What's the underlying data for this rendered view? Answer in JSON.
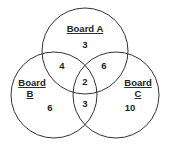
{
  "diagram": {
    "type": "venn",
    "sets": [
      {
        "id": "A",
        "label_line1": "Board A",
        "label_line2": "",
        "only": "3"
      },
      {
        "id": "B",
        "label_line1": "Board",
        "label_line2": "B",
        "only": "6"
      },
      {
        "id": "C",
        "label_line1": "Board",
        "label_line2": "C",
        "only": "10"
      }
    ],
    "intersections": {
      "AB": "4",
      "AC": "6",
      "BC": "3",
      "ABC": "2"
    },
    "colors": {
      "stroke": "#333333",
      "text": "#222222",
      "background": "#ffffff"
    }
  }
}
